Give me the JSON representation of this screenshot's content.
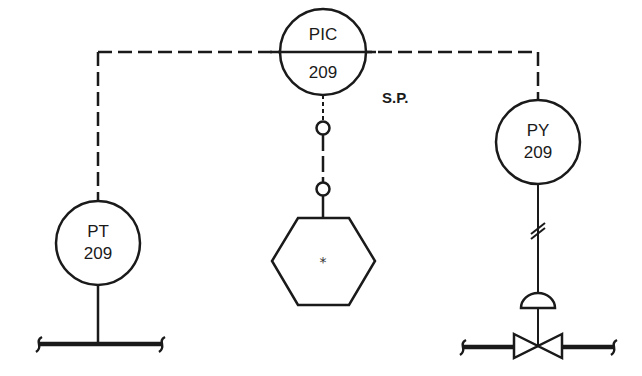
{
  "diagram": {
    "type": "P&ID pressure control loop",
    "instruments": {
      "pic": {
        "tag": "PIC",
        "number": "209",
        "role": "pressure indicating controller"
      },
      "pt": {
        "tag": "PT",
        "number": "209",
        "role": "pressure transmitter"
      },
      "py": {
        "tag": "PY",
        "number": "209",
        "role": "pressure relay / converter"
      }
    },
    "annotations": {
      "setpoint": "S.P.",
      "hexagon_symbol": "*"
    },
    "signal_lines": {
      "electric": "dashed",
      "pneumatic": "solid with double slash"
    },
    "colors": {
      "line": "#1a1a1a",
      "background": "#ffffff"
    }
  }
}
